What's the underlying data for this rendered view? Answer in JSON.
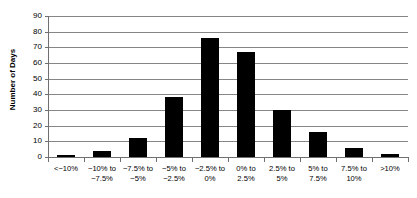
{
  "chart_data": {
    "type": "bar",
    "title": "",
    "xlabel": "",
    "ylabel": "Number of Days",
    "ylim": [
      0,
      90
    ],
    "ytick_step": 10,
    "yticks": [
      "90",
      "80",
      "70",
      "60",
      "50",
      "40",
      "30",
      "20",
      "10",
      "0"
    ],
    "grid": true,
    "legend": false,
    "bar_color": "#000000",
    "gridline_color": "#868686",
    "categories": [
      "<−10%",
      "−10% to\n−7.5%",
      "−7.5% to\n−5%",
      "−5% to\n−2.5%",
      "−2.5% to\n0%",
      "0% to\n2.5%",
      "2.5% to\n5%",
      "5% to\n7.5%",
      "7.5% to\n10%",
      ">10%"
    ],
    "values": [
      1,
      4,
      12,
      38,
      76,
      67,
      30,
      16,
      6,
      2
    ]
  }
}
